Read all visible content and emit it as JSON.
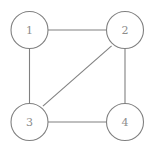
{
  "diagram": {
    "type": "node-link-graph",
    "canvas": {
      "width": 155,
      "height": 153,
      "background": "#ffffff"
    },
    "style": {
      "edge_color": "#808080",
      "edge_width": 1.1,
      "node_stroke_color": "#808080",
      "node_fill_color": "#ffffff",
      "node_radius": 18.5,
      "label_color": "#8c8c8c",
      "label_font_size": 11
    },
    "nodes": [
      {
        "id": "1",
        "label": "1",
        "cx": 29.5,
        "cy": 30,
        "r": 18.5
      },
      {
        "id": "2",
        "label": "2",
        "cx": 125,
        "cy": 30,
        "r": 18.5
      },
      {
        "id": "3",
        "label": "3",
        "cx": 29.5,
        "cy": 122,
        "r": 18.5
      },
      {
        "id": "4",
        "label": "4",
        "cx": 125,
        "cy": 122,
        "r": 18.5
      }
    ],
    "edges": [
      {
        "id": "edge-1-2",
        "source": "1",
        "target": "2",
        "x1": 48,
        "y1": 30,
        "x2": 106.5,
        "y2": 30
      },
      {
        "id": "edge-1-3",
        "source": "1",
        "target": "3",
        "x1": 29.5,
        "y1": 48.5,
        "x2": 29.5,
        "y2": 103.5
      },
      {
        "id": "edge-2-4",
        "source": "2",
        "target": "4",
        "x1": 125,
        "y1": 48.5,
        "x2": 125,
        "y2": 103.5
      },
      {
        "id": "edge-3-4",
        "source": "3",
        "target": "4",
        "x1": 48,
        "y1": 122,
        "x2": 106.5,
        "y2": 122
      },
      {
        "id": "edge-3-2",
        "source": "3",
        "target": "2",
        "x1": 42.9,
        "y1": 106.2,
        "x2": 111.6,
        "y2": 45.8
      }
    ]
  }
}
